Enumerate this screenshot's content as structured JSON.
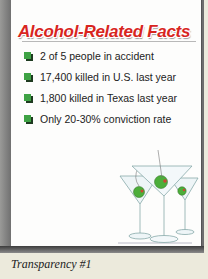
{
  "slide": {
    "title": "Alcohol-Related Facts",
    "bullets": [
      "2 of 5 people in accident",
      "17,400 killed in U.S. last year",
      "1,800 killed in Texas last year",
      "Only 20-30% conviction rate"
    ],
    "bullet_icon": "green-square-bullet-icon",
    "illustration": "martini-glasses-with-olives",
    "title_color": "#d8251e",
    "bullet_color": "#3ea244"
  },
  "caption": "Transparency #1"
}
